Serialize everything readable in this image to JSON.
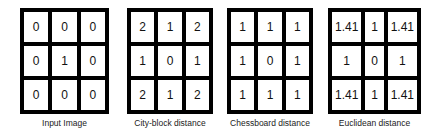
{
  "panels": [
    {
      "caption": "Input Image",
      "cells": [
        "0",
        "0",
        "0",
        "0",
        "1",
        "0",
        "0",
        "0",
        "0"
      ]
    },
    {
      "caption": "City-block distance",
      "cells": [
        "2",
        "1",
        "2",
        "1",
        "0",
        "1",
        "2",
        "1",
        "2"
      ]
    },
    {
      "caption": "Chessboard distance",
      "cells": [
        "1",
        "1",
        "1",
        "1",
        "0",
        "1",
        "1",
        "1",
        "1"
      ]
    },
    {
      "caption": "Euclidean distance",
      "cells": [
        "1.41",
        "1",
        "1.41",
        "1",
        "0",
        "1",
        "1.41",
        "1",
        "1.41"
      ]
    }
  ]
}
